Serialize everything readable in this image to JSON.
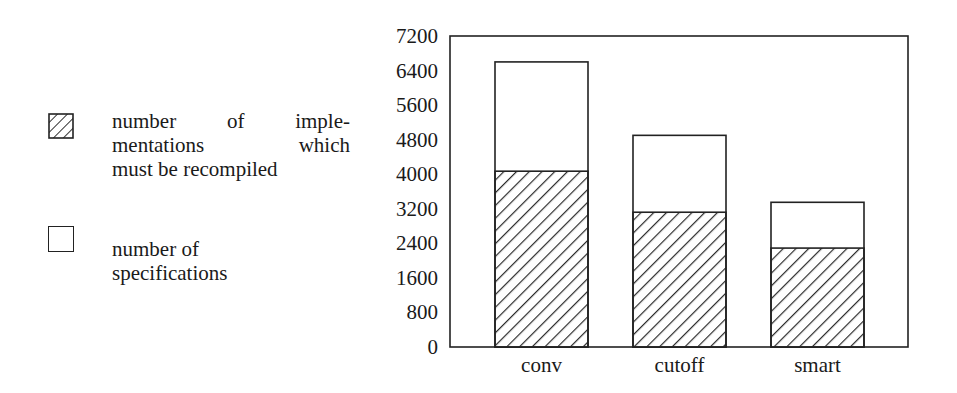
{
  "chart_data": {
    "type": "bar",
    "stacked": true,
    "title": "",
    "xlabel": "",
    "ylabel": "",
    "categories": [
      "conv",
      "cutoff",
      "smart"
    ],
    "series": [
      {
        "name": "number of implementations which must be recompiled",
        "pattern": "hatched",
        "values": [
          4070,
          3120,
          2290
        ]
      },
      {
        "name": "number of specifications",
        "pattern": "white",
        "values": [
          6600,
          4900,
          3350
        ],
        "note": "bar total height (outline); hatched portion overlaid from zero"
      }
    ],
    "ylim": [
      0,
      7200
    ],
    "yticks": [
      "0",
      "800",
      "1600",
      "2400",
      "3200",
      "4000",
      "4800",
      "5600",
      "6400",
      "7200"
    ],
    "grid": false,
    "legend_position": "left"
  },
  "legend": {
    "items": [
      {
        "lines": [
          "number of imple-",
          "mentations which",
          "must be recompiled"
        ],
        "swatch": "hatched"
      },
      {
        "lines": [
          "number of",
          "specifications"
        ],
        "swatch": "white"
      }
    ]
  },
  "axis": {
    "ticks": [
      "7200",
      "6400",
      "5600",
      "4800",
      "4000",
      "3200",
      "2400",
      "1600",
      "800",
      "0"
    ]
  },
  "colors": {
    "ink": "#1a1a1a",
    "background": "#ffffff"
  }
}
